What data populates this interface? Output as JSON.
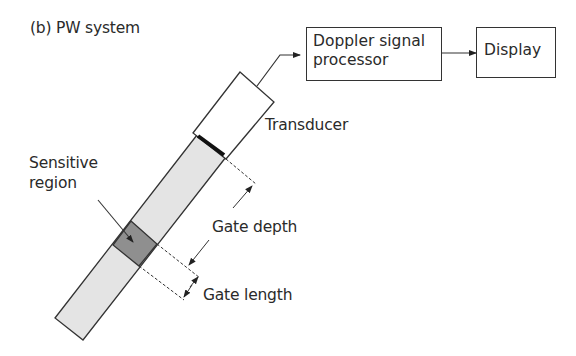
{
  "title": "(b) PW system",
  "blocks": {
    "processor": {
      "line1": "Doppler signal",
      "line2": "processor"
    },
    "display": "Display"
  },
  "labels": {
    "transducer": "Transducer",
    "sensitive_region_line1": "Sensitive",
    "sensitive_region_line2": "region",
    "gate_depth": "Gate depth",
    "gate_length": "Gate length"
  },
  "colors": {
    "beam_fill": "#e4e4e4",
    "sensitive_fill": "#8f8f8f",
    "face_bar": "#111111",
    "stroke": "#333333"
  }
}
